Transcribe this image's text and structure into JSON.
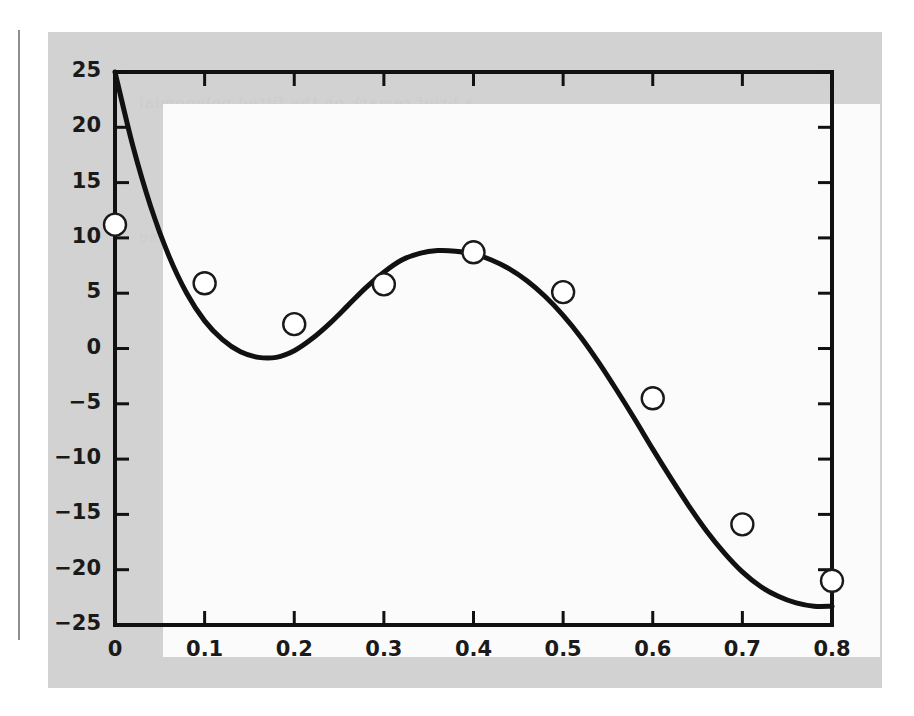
{
  "figure": {
    "panel_background": "#d2d2d2",
    "plot_background": "#fbfbfb",
    "axis_color": "#111111",
    "curve_color": "#111111",
    "marker_edge_color": "#1a1a1a",
    "marker_fill_color": "#ffffff"
  },
  "ghost_text": [
    "a brief remark on the fitted polynomial",
    "the residuals of a ninth order curve",
    "of the data points are shown here",
    "least squares approximation to noise",
    "table of values with interpolation",
    "the resulting polynomial oscillates"
  ],
  "chart_data": {
    "type": "line",
    "title": "",
    "xlabel": "",
    "ylabel": "",
    "xlim": [
      0,
      0.8
    ],
    "ylim": [
      -25,
      25
    ],
    "xticks": [
      0,
      0.1,
      0.2,
      0.3,
      0.4,
      0.5,
      0.6,
      0.7,
      0.8
    ],
    "xtick_labels": [
      "0",
      "0.1",
      "0.2",
      "0.3",
      "0.4",
      "0.5",
      "0.6",
      "0.7",
      "0.8"
    ],
    "yticks": [
      -25,
      -20,
      -15,
      -10,
      -5,
      0,
      5,
      10,
      15,
      20,
      25
    ],
    "ytick_labels": [
      "−25",
      "−20",
      "−15",
      "−10",
      "−5",
      "0",
      "5",
      "10",
      "15",
      "20",
      "25"
    ],
    "grid": false,
    "legend": null,
    "series": [
      {
        "name": "fitted curve",
        "style": "line",
        "linewidth": 5,
        "x": [
          0.0,
          0.02,
          0.04,
          0.06,
          0.08,
          0.1,
          0.12,
          0.14,
          0.16,
          0.18,
          0.2,
          0.22,
          0.24,
          0.26,
          0.28,
          0.3,
          0.32,
          0.34,
          0.36,
          0.38,
          0.4,
          0.42,
          0.44,
          0.46,
          0.48,
          0.5,
          0.52,
          0.54,
          0.56,
          0.58,
          0.6,
          0.62,
          0.64,
          0.66,
          0.68,
          0.7,
          0.72,
          0.74,
          0.76,
          0.78,
          0.8
        ],
        "y": [
          25.0,
          18.3,
          12.8,
          8.4,
          5.0,
          2.5,
          0.8,
          -0.3,
          -0.8,
          -0.8,
          -0.2,
          0.9,
          2.3,
          3.9,
          5.5,
          6.9,
          8.0,
          8.6,
          8.85,
          8.8,
          8.55,
          8.0,
          7.2,
          6.1,
          4.7,
          3.0,
          1.0,
          -1.3,
          -3.8,
          -6.4,
          -9.1,
          -11.7,
          -14.2,
          -16.5,
          -18.5,
          -20.2,
          -21.5,
          -22.4,
          -23.0,
          -23.3,
          -23.3
        ]
      },
      {
        "name": "data points",
        "style": "marker",
        "marker": "open-circle",
        "x": [
          0.0,
          0.1,
          0.2,
          0.3,
          0.4,
          0.5,
          0.6,
          0.7,
          0.8
        ],
        "y": [
          11.2,
          5.9,
          2.2,
          5.8,
          8.7,
          5.1,
          -4.5,
          -15.9,
          -21.0
        ]
      }
    ]
  }
}
